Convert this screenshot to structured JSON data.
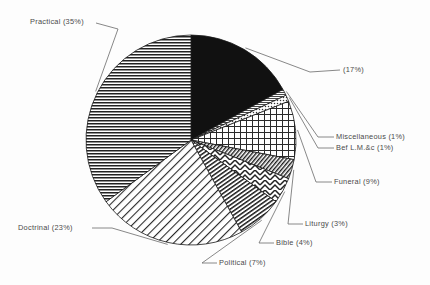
{
  "chart_data": {
    "type": "pie",
    "title": "",
    "subtitle": "",
    "xlabel": "",
    "ylabel": "",
    "legend_position": "callout-labels",
    "grid": false,
    "units": "percent",
    "total": 100,
    "start_angle_deg": 0,
    "direction": "clockwise",
    "categories": [
      "",
      "Miscellaneous",
      "Bef L.M.&c",
      "Funeral",
      "Liturgy",
      "Bible",
      "Political",
      "Doctrinal",
      "Practical"
    ],
    "values": [
      17,
      1,
      1,
      9,
      3,
      4,
      7,
      23,
      35
    ],
    "slices": [
      {
        "name": "unlabeled-black",
        "label": "(17%)",
        "category": "",
        "value": 17,
        "pattern": "solid-black",
        "fill": "#111111"
      },
      {
        "name": "miscellaneous",
        "label": "Miscellaneous (1%)",
        "category": "Miscellaneous",
        "value": 1,
        "pattern": "fine-horizontal",
        "fill": "#ffffff"
      },
      {
        "name": "bef-lm-c",
        "label": "Bef L.M.&c (1%)",
        "category": "Bef L.M.&c",
        "value": 1,
        "pattern": "fine-dots",
        "fill": "#ffffff"
      },
      {
        "name": "funeral",
        "label": "Funeral (9%)",
        "category": "Funeral",
        "value": 9,
        "pattern": "cross-hatch-grid",
        "fill": "#ffffff"
      },
      {
        "name": "liturgy",
        "label": "Liturgy (3%)",
        "category": "Liturgy",
        "value": 3,
        "pattern": "dense-diagonal",
        "fill": "#ffffff"
      },
      {
        "name": "bible",
        "label": "Bible (4%)",
        "category": "Bible",
        "value": 4,
        "pattern": "chevron",
        "fill": "#ffffff"
      },
      {
        "name": "political",
        "label": "Political (7%)",
        "category": "Political",
        "value": 7,
        "pattern": "steep-diagonal",
        "fill": "#ffffff"
      },
      {
        "name": "doctrinal",
        "label": "Doctrinal (23%)",
        "category": "Doctrinal",
        "value": 23,
        "pattern": "light-diagonal",
        "fill": "#ffffff"
      },
      {
        "name": "practical",
        "label": "Practical (35%)",
        "category": "Practical",
        "value": 35,
        "pattern": "horizontal-lines",
        "fill": "#ffffff"
      }
    ],
    "colors": {
      "outline": "#1a1a1a",
      "leader": "#6a6a6a",
      "text": "#4a4a4a",
      "background": "#fdfdfd"
    }
  },
  "labels": {
    "practical": "Practical (35%)",
    "unlabeled": "(17%)",
    "miscellaneous": "Miscellaneous (1%)",
    "bef_lm_c": "Bef L.M.&c (1%)",
    "funeral": "Funeral (9%)",
    "liturgy": "Liturgy (3%)",
    "bible": "Bible (4%)",
    "political": "Political (7%)",
    "doctrinal": "Doctrinal (23%)"
  }
}
